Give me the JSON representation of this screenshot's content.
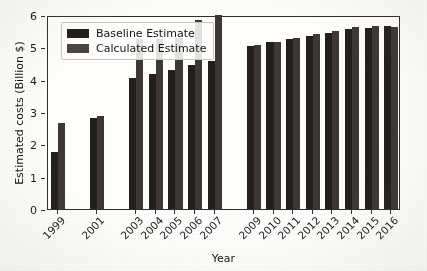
{
  "chart_data": {
    "type": "bar",
    "title": "",
    "xlabel": "Year",
    "ylabel": "Estimated costs (Billion $)",
    "ylim": [
      0,
      6
    ],
    "yticks": [
      0,
      1,
      2,
      3,
      4,
      5,
      6
    ],
    "grid": false,
    "legend_position": "upper left",
    "categories": [
      "1999",
      "2001",
      "2003",
      "2004",
      "2005",
      "2006",
      "2007",
      "2009",
      "2010",
      "2011",
      "2012",
      "2013",
      "2014",
      "2015",
      "2016"
    ],
    "slot_index": [
      0,
      2,
      4,
      5,
      6,
      7,
      8,
      10,
      11,
      12,
      13,
      14,
      15,
      16,
      17
    ],
    "total_slots": 18,
    "series": [
      {
        "name": "Baseline Estimate",
        "color": "#231f1d",
        "values": [
          1.75,
          2.8,
          4.05,
          4.17,
          4.3,
          4.45,
          4.57,
          5.05,
          5.15,
          5.27,
          5.35,
          5.45,
          5.57,
          5.6,
          5.65
        ]
      },
      {
        "name": "Calculated Estimate",
        "color": "#3d3834",
        "values": [
          2.67,
          2.88,
          5.25,
          5.25,
          5.28,
          5.85,
          6.0,
          5.08,
          5.18,
          5.28,
          5.42,
          5.5,
          5.62,
          5.65,
          5.62
        ]
      }
    ]
  },
  "legend": {
    "items": [
      {
        "label": "Baseline Estimate",
        "swatch": "base"
      },
      {
        "label": "Calculated Estimate",
        "swatch": "calc"
      }
    ]
  },
  "axes": {
    "y_title": "Estimated costs (Billion $)",
    "x_title": "Year",
    "y_tick_labels": [
      "0",
      "1",
      "2",
      "3",
      "4",
      "5",
      "6"
    ],
    "x_tick_labels": [
      "1999",
      "2001",
      "2003",
      "2004",
      "2005",
      "2006",
      "2007",
      "2009",
      "2010",
      "2011",
      "2012",
      "2013",
      "2014",
      "2015",
      "2016"
    ]
  }
}
